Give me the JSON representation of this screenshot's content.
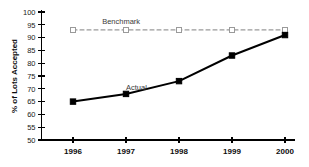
{
  "chart_data": {
    "type": "line",
    "title": "",
    "xlabel": "",
    "ylabel": "% of Lots Accepted",
    "categories": [
      "1996",
      "1997",
      "1998",
      "1999",
      "2000"
    ],
    "x": [
      1996,
      1997,
      1998,
      1999,
      2000
    ],
    "ylim": [
      50,
      100
    ],
    "yticks": [
      50,
      55,
      60,
      65,
      70,
      75,
      80,
      85,
      90,
      95,
      100
    ],
    "ytick_labels": [
      "50",
      "55",
      "60",
      "65",
      "70",
      "75",
      "80",
      "85",
      "90",
      "95",
      "100"
    ],
    "grid": false,
    "legend_position": "inline-annotations",
    "series": [
      {
        "name": "Benchmark",
        "values": [
          93,
          93,
          93,
          93,
          93
        ],
        "marker": "open-square",
        "line_style": "dashed",
        "color": "#9a9a9a"
      },
      {
        "name": "Actual",
        "values": [
          65,
          68,
          73,
          83,
          91
        ],
        "marker": "filled-square",
        "line_style": "solid",
        "color": "#000000"
      }
    ],
    "annotations": [
      {
        "text": "Benchmark",
        "series": "Benchmark",
        "x": 1996.55,
        "y": 95.2
      },
      {
        "text": "Actual",
        "series": "Actual",
        "x": 1997.0,
        "y": 69.6
      }
    ]
  },
  "axes": {
    "y_axis_title": "% of Lots Accepted",
    "y_min_label": "50",
    "y_max_label": "100"
  }
}
